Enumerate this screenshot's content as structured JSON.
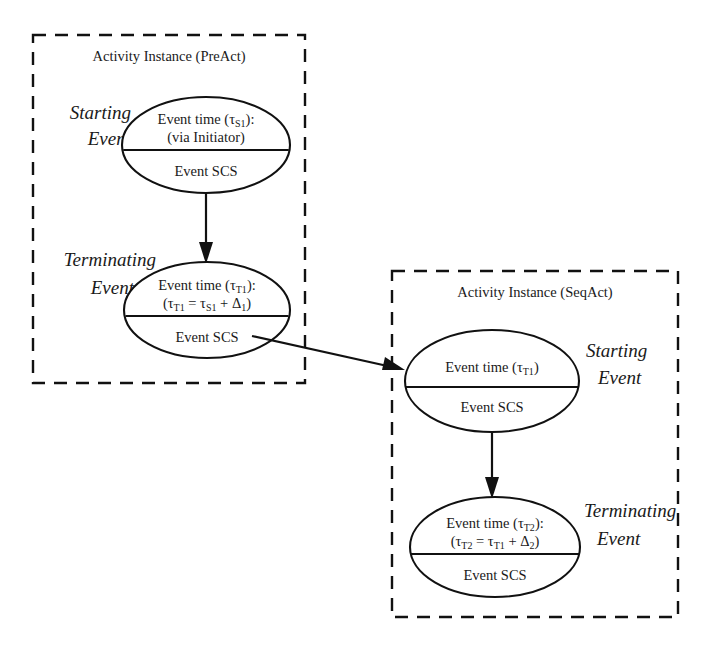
{
  "figure": {
    "type": "activity-instance-sequence-diagram",
    "background": "#ffffff",
    "stroke_color": "#111111",
    "text_color": "#1a1a1a"
  },
  "boxes": [
    {
      "id": "preact",
      "title": "Activity Instance (PreAct)",
      "x": 33,
      "y": 35,
      "width": 272,
      "height": 348
    },
    {
      "id": "seqact",
      "title": "Activity Instance (SeqAct)",
      "x": 392,
      "y": 271,
      "width": 286,
      "height": 346
    }
  ],
  "labels": {
    "preact_starting": {
      "line1": "Starting",
      "line2": "Event"
    },
    "preact_terminating": {
      "line1": "Terminating",
      "line2": "Event"
    },
    "seqact_starting": {
      "line1": "Starting",
      "line2": "Event"
    },
    "seqact_terminating": {
      "line1": "Terminating",
      "line2": "Event"
    }
  },
  "events": [
    {
      "id": "preact-starting-event",
      "box": "preact",
      "role": "Starting Event",
      "cx": 206,
      "cy": 145,
      "rx": 84,
      "ry": 48,
      "top_lines": [
        {
          "pre": "Event time (τ",
          "sub": "S1",
          "post": "):"
        },
        {
          "pre": "(via Initiator)",
          "sub": "",
          "post": ""
        }
      ],
      "bottom_text": "Event SCS"
    },
    {
      "id": "preact-terminating-event",
      "box": "preact",
      "role": "Terminating Event",
      "cx": 207,
      "cy": 310,
      "rx": 83,
      "ry": 48,
      "top_lines": [
        {
          "pre": "Event time (τ",
          "sub": "T1",
          "post": "):"
        },
        {
          "pre": "(τ",
          "sub": "T1",
          "post": " = τ",
          "sub2": "S1",
          "post2": " + Δ",
          "sub3": "1",
          "post3": ")"
        }
      ],
      "bottom_text": "Event SCS"
    },
    {
      "id": "seqact-starting-event",
      "box": "seqact",
      "role": "Starting Event",
      "cx": 492,
      "cy": 381,
      "rx": 87,
      "ry": 51,
      "top_lines": [
        {
          "pre": "Event time (τ",
          "sub": "T1",
          "post": ")"
        }
      ],
      "bottom_text": "Event SCS"
    },
    {
      "id": "seqact-terminating-event",
      "box": "seqact",
      "role": "Terminating Event",
      "cx": 495,
      "cy": 547,
      "rx": 85,
      "ry": 50,
      "top_lines": [
        {
          "pre": "Event time (τ",
          "sub": "T2",
          "post": "):"
        },
        {
          "pre": "(τ",
          "sub": "T2",
          "post": " = τ",
          "sub2": "T1",
          "post2": " + Δ",
          "sub3": "2",
          "post3": ")"
        }
      ],
      "bottom_text": "Event SCS"
    }
  ],
  "arrows": [
    {
      "id": "preact-start-to-terminating",
      "from": "preact-starting-event",
      "to": "preact-terminating-event",
      "x1": 206,
      "y1": 194,
      "x2": 206,
      "y2": 262,
      "kind": "vertical"
    },
    {
      "id": "preact-terminating-to-seqact-start",
      "from": "preact-terminating-event",
      "to": "seqact-starting-event",
      "x1": 252,
      "y1": 336,
      "x2": 402,
      "y2": 369,
      "kind": "diagonal"
    },
    {
      "id": "seqact-start-to-terminating",
      "from": "seqact-starting-event",
      "to": "seqact-terminating-event",
      "x1": 492,
      "y1": 432,
      "x2": 492,
      "y2": 497,
      "kind": "vertical"
    }
  ]
}
